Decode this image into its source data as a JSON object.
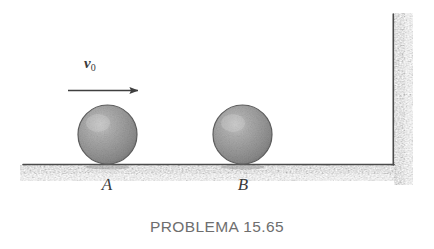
{
  "figure": {
    "caption": "PROBLEMA 15.65",
    "velocity": {
      "symbol": "v",
      "subscript": "0",
      "full_label": "v0"
    },
    "bodies": [
      {
        "label": "A",
        "name": "sphere-a"
      },
      {
        "label": "B",
        "name": "sphere-b"
      }
    ],
    "colors": {
      "sphere_fill": "#9a9a9a",
      "sphere_edge": "#555555",
      "sphere_highlight": "#c4c4c4",
      "ground_line": "#4a4a4a",
      "hatch": "#b8b8b8",
      "caption_text": "#6e6e6e",
      "label_text": "#3b3b3b",
      "background": "#ffffff"
    }
  }
}
